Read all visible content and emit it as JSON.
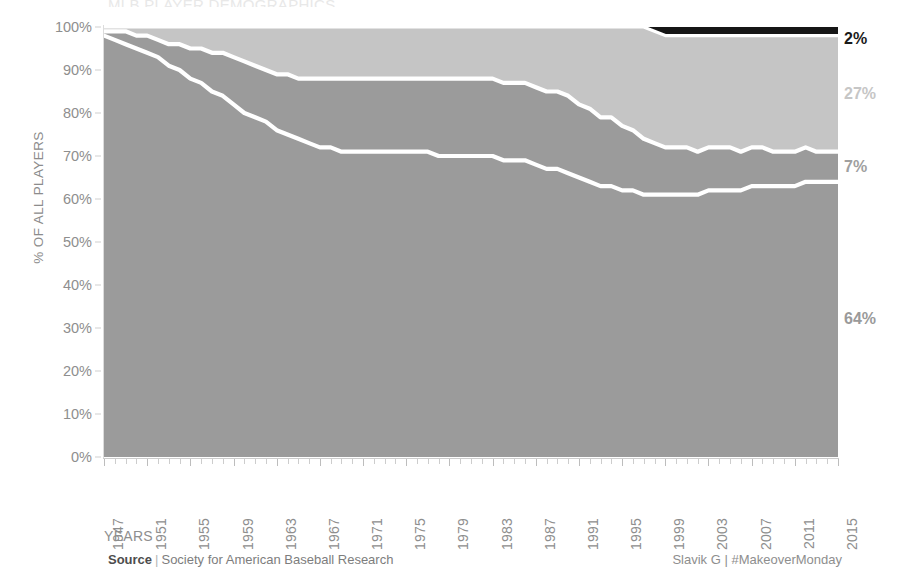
{
  "title_sliver": "MLB PLAYER DEMOGRAPHICS",
  "axes": {
    "y_title": "% OF ALL PLAYERS",
    "x_title": "YEARS",
    "y_ticks": [
      "0%",
      "10%",
      "20%",
      "30%",
      "40%",
      "50%",
      "60%",
      "70%",
      "80%",
      "90%",
      "100%"
    ],
    "x_ticks": [
      "1947",
      "1951",
      "1955",
      "1959",
      "1963",
      "1967",
      "1971",
      "1975",
      "1979",
      "1983",
      "1987",
      "1991",
      "1995",
      "1999",
      "2003",
      "2007",
      "2011",
      "2015"
    ]
  },
  "end_labels": [
    {
      "text": "2%",
      "color": "#1a1a1a"
    },
    {
      "text": "27%",
      "color": "#c6c6c6"
    },
    {
      "text": "7%",
      "color": "#a0a0a0"
    },
    {
      "text": "64%",
      "color": "#9a9a9a"
    }
  ],
  "colors": {
    "band_bottom": "#9b9b9b",
    "band_second": "#9b9b9b",
    "band_third": "#c5c5c5",
    "band_top": "#161616",
    "separator": "#ffffff",
    "axis_text": "#8e8e8e",
    "background": "#ffffff"
  },
  "footer": {
    "source_label": "Source",
    "separator": "|",
    "source_value": "Society for American Baseball Research",
    "credit": "Slavik G | #MakeoverMonday"
  },
  "chart_data": {
    "type": "area",
    "title": "MLB PLAYER DEMOGRAPHICS",
    "xlabel": "YEARS",
    "ylabel": "% OF ALL PLAYERS",
    "ylim": [
      0,
      100
    ],
    "xlim": [
      1947,
      2015
    ],
    "grid": false,
    "legend_position": "right-end-labels",
    "stacked": true,
    "stack_total": 100,
    "x": [
      1947,
      1948,
      1949,
      1950,
      1951,
      1952,
      1953,
      1954,
      1955,
      1956,
      1957,
      1958,
      1959,
      1960,
      1961,
      1962,
      1963,
      1964,
      1965,
      1966,
      1967,
      1968,
      1969,
      1970,
      1971,
      1972,
      1973,
      1974,
      1975,
      1976,
      1977,
      1978,
      1979,
      1980,
      1981,
      1982,
      1983,
      1984,
      1985,
      1986,
      1987,
      1988,
      1989,
      1990,
      1991,
      1992,
      1993,
      1994,
      1995,
      1996,
      1997,
      1998,
      1999,
      2000,
      2001,
      2002,
      2003,
      2004,
      2005,
      2006,
      2007,
      2008,
      2009,
      2010,
      2011,
      2012,
      2013,
      2014,
      2015
    ],
    "series": [
      {
        "name": "band-bottom",
        "end_label": "64%",
        "color": "#9b9b9b",
        "values": [
          98,
          97,
          96,
          95,
          94,
          93,
          91,
          90,
          88,
          87,
          85,
          84,
          82,
          80,
          79,
          78,
          76,
          75,
          74,
          73,
          72,
          72,
          71,
          71,
          71,
          71,
          71,
          71,
          71,
          71,
          71,
          70,
          70,
          70,
          70,
          70,
          70,
          69,
          69,
          69,
          68,
          67,
          67,
          66,
          65,
          64,
          63,
          63,
          62,
          62,
          61,
          61,
          61,
          61,
          61,
          61,
          62,
          62,
          62,
          62,
          63,
          63,
          63,
          63,
          63,
          64,
          64,
          64,
          64
        ]
      },
      {
        "name": "band-second",
        "end_label": "7%",
        "color": "#9b9b9b",
        "values": [
          1,
          2,
          3,
          3,
          4,
          4,
          5,
          6,
          7,
          8,
          9,
          10,
          11,
          12,
          12,
          12,
          13,
          14,
          14,
          15,
          16,
          16,
          17,
          17,
          17,
          17,
          17,
          17,
          17,
          17,
          17,
          18,
          18,
          18,
          18,
          18,
          18,
          18,
          18,
          18,
          18,
          18,
          18,
          18,
          17,
          17,
          16,
          16,
          15,
          14,
          13,
          12,
          11,
          11,
          11,
          10,
          10,
          10,
          10,
          9,
          9,
          9,
          8,
          8,
          8,
          8,
          7,
          7,
          7
        ]
      },
      {
        "name": "band-third",
        "end_label": "27%",
        "color": "#c5c5c5",
        "values": [
          1,
          1,
          1,
          2,
          2,
          3,
          4,
          4,
          5,
          5,
          6,
          6,
          7,
          8,
          9,
          10,
          11,
          11,
          12,
          12,
          12,
          12,
          12,
          12,
          12,
          12,
          12,
          12,
          12,
          12,
          12,
          12,
          12,
          12,
          12,
          12,
          12,
          13,
          13,
          13,
          14,
          15,
          15,
          16,
          18,
          19,
          21,
          21,
          23,
          24,
          26,
          26,
          26,
          26,
          26,
          27,
          26,
          26,
          26,
          27,
          26,
          26,
          27,
          27,
          27,
          26,
          27,
          27,
          27
        ]
      },
      {
        "name": "band-top",
        "end_label": "2%",
        "color": "#161616",
        "values": [
          0,
          0,
          0,
          0,
          0,
          0,
          0,
          0,
          0,
          0,
          0,
          0,
          0,
          0,
          0,
          0,
          0,
          0,
          0,
          0,
          0,
          0,
          0,
          0,
          0,
          0,
          0,
          0,
          0,
          0,
          0,
          0,
          0,
          0,
          0,
          0,
          0,
          0,
          0,
          0,
          0,
          0,
          0,
          0,
          0,
          0,
          0,
          0,
          0,
          0,
          0,
          1,
          2,
          2,
          2,
          2,
          2,
          2,
          2,
          2,
          2,
          2,
          2,
          2,
          2,
          2,
          2,
          2,
          2
        ]
      }
    ]
  }
}
